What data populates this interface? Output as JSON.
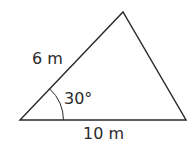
{
  "diagram": {
    "type": "triangle",
    "stroke_color": "#2a2a2a",
    "vertices": {
      "bottom_left": [
        20,
        120
      ],
      "apex": [
        123,
        12
      ],
      "bottom_right": [
        186,
        120
      ]
    },
    "labels": {
      "left_side": "6 m",
      "angle": "30°",
      "base": "10 m"
    }
  }
}
